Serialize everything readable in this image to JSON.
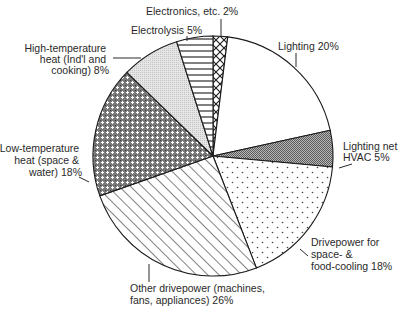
{
  "chart_data": {
    "type": "pie",
    "title": "",
    "units": "%",
    "start_angle_deg": 0,
    "direction": "clockwise",
    "slices": [
      {
        "name": "Electronics, etc.",
        "value": 2,
        "label_lines": [
          "Electronics, etc. 2%"
        ],
        "fill": "crosshatch-x"
      },
      {
        "name": "Lighting",
        "value": 20,
        "label_lines": [
          "Lighting 20%"
        ],
        "fill": "white"
      },
      {
        "name": "Lighting net HVAC",
        "value": 5,
        "label_lines": [
          "Lighting net",
          "HVAC 5%"
        ],
        "fill": "dark-gray-stipple"
      },
      {
        "name": "Drivepower for space- & food-cooling",
        "value": 18,
        "label_lines": [
          "Drivepower for",
          "space- &",
          "food-cooling 18%"
        ],
        "fill": "sparse-dots"
      },
      {
        "name": "Other drivepower (machines, fans, appliances)",
        "value": 26,
        "label_lines": [
          "Other drivepower (machines,",
          "fans, appliances) 26%"
        ],
        "fill": "diagonal-lines"
      },
      {
        "name": "Low-temperature heat (space & water)",
        "value": 18,
        "label_lines": [
          "Low-temperature",
          "heat (space &",
          "water) 18%"
        ],
        "fill": "dense-crosshatch"
      },
      {
        "name": "High-temperature heat (Ind'l and cooking)",
        "value": 8,
        "label_lines": [
          "High-temperature",
          "heat (Ind'l and",
          "cooking) 8%"
        ],
        "fill": "light-gray-stipple"
      },
      {
        "name": "Electrolysis",
        "value": 5,
        "label_lines": [
          "Electrolysis 5%"
        ],
        "fill": "horizontal-lines"
      }
    ],
    "legend": "none (direct labels with leader lines)"
  },
  "colors": {
    "outline": "#1a1a1a",
    "text": "#2a2a2a",
    "background": "#ffffff",
    "light_gray": "#d9d9d9",
    "dark_gray": "#8c8c8c"
  }
}
